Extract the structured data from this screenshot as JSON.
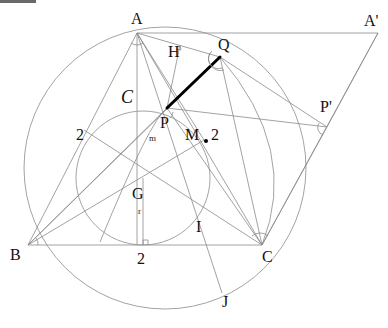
{
  "diagram": {
    "points": {
      "A": {
        "label": "A"
      },
      "A_prime": {
        "label": "A'"
      },
      "Q": {
        "label": "Q"
      },
      "P": {
        "label": "P"
      },
      "P_prime": {
        "label": "P'"
      },
      "H": {
        "label": "H"
      },
      "B": {
        "label": "B"
      },
      "C": {
        "label": "C"
      },
      "G": {
        "label": "G"
      },
      "M": {
        "label": "M"
      },
      "I": {
        "label": "I"
      },
      "J": {
        "label": "J"
      }
    },
    "circle_label": "C",
    "segment_labels": {
      "left_side": "2",
      "bottom_side": "2",
      "m_side": "2",
      "m": "m",
      "r": "r"
    },
    "highlighted_segment": "PQ",
    "colors": {
      "lines": "#8a8a8a",
      "highlight": "#000000",
      "text": "#111111"
    }
  }
}
